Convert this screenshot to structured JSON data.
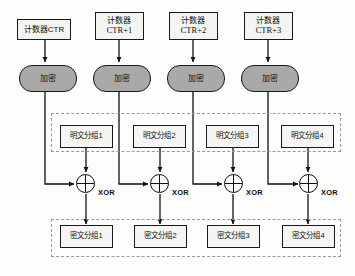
{
  "diagram": {
    "colors": {
      "stroke": "#1a1a1a",
      "cipher_fill": "#a9a9a9",
      "box_fill": "#f4f4f2",
      "dashed": "#9a9a9a",
      "background": "#fdfdfc"
    },
    "counters": [
      {
        "line1": "计数器CTR",
        "line2": ""
      },
      {
        "line1": "计数器",
        "line2": "CTR+1"
      },
      {
        "line1": "计数器",
        "line2": "CTR+2"
      },
      {
        "line1": "计数器",
        "line2": "CTR+3"
      }
    ],
    "encrypt_blocks": [
      {
        "label": "加密"
      },
      {
        "label": "加密"
      },
      {
        "label": "加密"
      },
      {
        "label": "加密"
      }
    ],
    "plaintext_blocks": [
      {
        "label": "明文分组1"
      },
      {
        "label": "明文分组2"
      },
      {
        "label": "明文分组3"
      },
      {
        "label": "明文分组4"
      }
    ],
    "xor_operators": [
      {
        "label": "XOR"
      },
      {
        "label": "XOR"
      },
      {
        "label": "XOR"
      },
      {
        "label": "XOR"
      }
    ],
    "ciphertext_blocks": [
      {
        "label": "密文分组1"
      },
      {
        "label": "密文分组2"
      },
      {
        "label": "密文分组3"
      },
      {
        "label": "密文分组4"
      }
    ]
  }
}
